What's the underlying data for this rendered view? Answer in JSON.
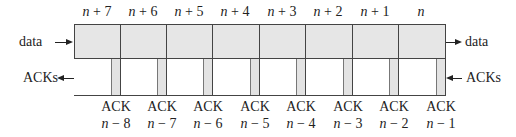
{
  "diagram": {
    "type": "sliding-window-segments",
    "colors": {
      "fill": "#e6e6e6",
      "stroke": "#444444",
      "text": "#222222"
    },
    "segments": [
      {
        "label": "n + 7"
      },
      {
        "label": "n + 6"
      },
      {
        "label": "n + 5"
      },
      {
        "label": "n + 4"
      },
      {
        "label": "n + 3"
      },
      {
        "label": "n + 2"
      },
      {
        "label": "n + 1"
      },
      {
        "label": "n"
      }
    ],
    "acks": [
      {
        "label": "ACK",
        "num": "n − 8"
      },
      {
        "label": "ACK",
        "num": "n − 7"
      },
      {
        "label": "ACK",
        "num": "n − 6"
      },
      {
        "label": "ACK",
        "num": "n − 5"
      },
      {
        "label": "ACK",
        "num": "n − 4"
      },
      {
        "label": "ACK",
        "num": "n − 3"
      },
      {
        "label": "ACK",
        "num": "n − 2"
      },
      {
        "label": "ACK",
        "num": "n − 1"
      }
    ],
    "left": {
      "data_label": "data",
      "acks_label": "ACKs"
    },
    "right": {
      "data_label": "data",
      "acks_label": "ACKs"
    }
  }
}
